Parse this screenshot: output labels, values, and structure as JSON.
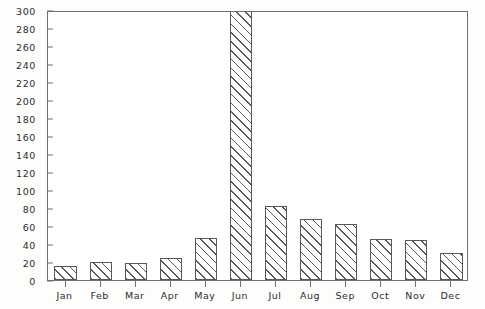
{
  "chart_data": {
    "type": "bar",
    "title": "",
    "subtitle": "",
    "xlabel": "",
    "ylabel": "",
    "categories": [
      "Jan",
      "Feb",
      "Mar",
      "Apr",
      "May",
      "Jun",
      "Jul",
      "Aug",
      "Sep",
      "Oct",
      "Nov",
      "Dec"
    ],
    "values": [
      16,
      20,
      19,
      24,
      47,
      300,
      82,
      68,
      62,
      46,
      44,
      30
    ],
    "value_notes": {
      "Jun": "bar is clipped at the top of the axis; actual value exceeds 300"
    },
    "ylim": [
      0,
      300
    ],
    "yticks": [
      0,
      20,
      40,
      60,
      80,
      100,
      120,
      140,
      160,
      180,
      200,
      220,
      240,
      260,
      280,
      300
    ],
    "ytick_labels": [
      "0",
      "20",
      "40",
      "60",
      "80",
      "100",
      "120",
      "140",
      "160",
      "180",
      "200",
      "220",
      "240",
      "260",
      "280",
      "300"
    ],
    "xtick_labels": [
      "Jan",
      "Feb",
      "Mar",
      "Apr",
      "May",
      "Jun",
      "Jul",
      "Aug",
      "Sep",
      "Oct",
      "Nov",
      "Dec"
    ],
    "grid": false,
    "legend": null,
    "legend_position": "none",
    "annotations": [],
    "series": [
      {
        "name": "",
        "values": [
          16,
          20,
          19,
          24,
          47,
          300,
          82,
          68,
          62,
          46,
          44,
          30
        ]
      }
    ],
    "style": {
      "bar_fill": "diagonal-hatch",
      "bar_edge_color": "#58585a",
      "hatch_color": "#59595b",
      "background_color": "#ffffff",
      "axis_color": "#6f6f6f",
      "text_color": "#2c2c2c"
    }
  }
}
